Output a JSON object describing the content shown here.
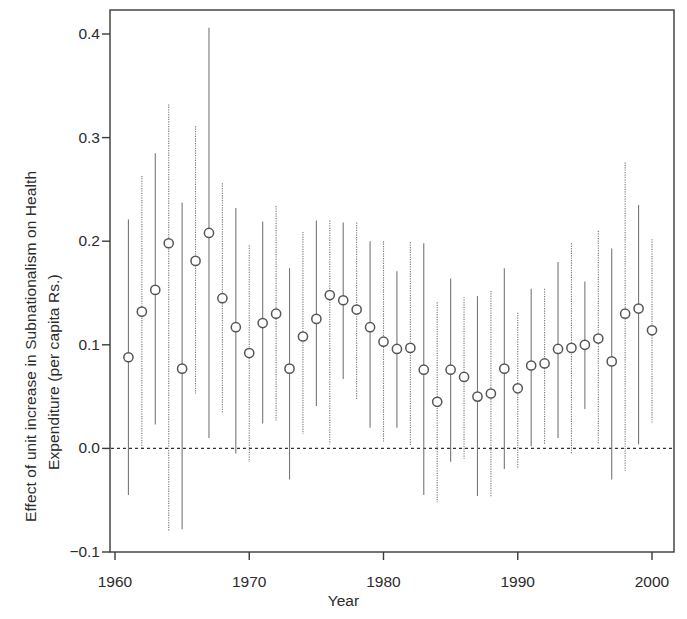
{
  "chart_data": {
    "type": "scatter",
    "title": "",
    "xlabel": "Year",
    "ylabel": "Effect of unit increase in Subnationalism on Health Expenditure (per capita Rs.)",
    "ylabel_line1": "Effect of unit increase in Subnationalism on Health",
    "ylabel_line2": "Expenditure (per capita Rs.)",
    "xlim": [
      1959.6,
      2001.6
    ],
    "ylim": [
      -0.1,
      0.43
    ],
    "xticks": [
      1960,
      1970,
      1980,
      1990,
      2000
    ],
    "xtick_labels": [
      "1960",
      "1970",
      "1980",
      "1990",
      "2000"
    ],
    "yticks": [
      -0.1,
      0.0,
      0.1,
      0.2,
      0.3,
      0.4
    ],
    "ytick_labels": [
      "-0.1",
      "0.0",
      "0.1",
      "0.2",
      "0.3",
      "0.4"
    ],
    "grid": false,
    "legend": null,
    "reference_line": {
      "y": 0.0,
      "style": "dotted",
      "color": "#333333"
    },
    "marker": {
      "shape": "circle-open",
      "color": "#555555",
      "size": 7
    },
    "errorbar": {
      "style": "vertical-line",
      "color": "#777777"
    },
    "x": [
      1961,
      1962,
      1963,
      1964,
      1965,
      1966,
      1967,
      1968,
      1969,
      1970,
      1971,
      1972,
      1973,
      1974,
      1975,
      1976,
      1977,
      1978,
      1979,
      1980,
      1981,
      1982,
      1983,
      1984,
      1985,
      1986,
      1987,
      1988,
      1989,
      1990,
      1991,
      1992,
      1993,
      1994,
      1995,
      1996,
      1997,
      1998,
      1999,
      2000
    ],
    "values": [
      0.088,
      0.132,
      0.153,
      0.198,
      0.077,
      0.181,
      0.208,
      0.145,
      0.117,
      0.092,
      0.121,
      0.13,
      0.077,
      0.108,
      0.125,
      0.148,
      0.143,
      0.134,
      0.117,
      0.103,
      0.096,
      0.097,
      0.076,
      0.045,
      0.076,
      0.069,
      0.05,
      0.053,
      0.077,
      0.058,
      0.08,
      0.082,
      0.096,
      0.097,
      0.1,
      0.106,
      0.084,
      0.13,
      0.135,
      0.114
    ],
    "lower": [
      -0.045,
      0.0,
      0.023,
      -0.08,
      -0.078,
      0.053,
      0.01,
      0.034,
      -0.005,
      -0.013,
      0.024,
      0.027,
      -0.03,
      0.014,
      0.041,
      0.004,
      0.067,
      0.047,
      0.02,
      0.006,
      0.02,
      0.002,
      -0.045,
      -0.052,
      -0.013,
      -0.01,
      -0.046,
      -0.047,
      -0.02,
      -0.02,
      0.002,
      0.004,
      0.01,
      -0.006,
      0.038,
      0.004,
      -0.03,
      -0.022,
      0.004,
      0.025
    ],
    "upper": [
      0.221,
      0.263,
      0.285,
      0.332,
      0.237,
      0.311,
      0.406,
      0.256,
      0.232,
      0.196,
      0.219,
      0.234,
      0.174,
      0.209,
      0.22,
      0.22,
      0.218,
      0.218,
      0.2,
      0.2,
      0.171,
      0.199,
      0.198,
      0.141,
      0.164,
      0.146,
      0.147,
      0.152,
      0.174,
      0.131,
      0.154,
      0.154,
      0.18,
      0.198,
      0.161,
      0.21,
      0.193,
      0.276,
      0.235,
      0.202
    ],
    "series": [
      {
        "name": "Effect estimate",
        "values": [
          0.088,
          0.132,
          0.153,
          0.198,
          0.077,
          0.181,
          0.208,
          0.145,
          0.117,
          0.092,
          0.121,
          0.13,
          0.077,
          0.108,
          0.125,
          0.148,
          0.143,
          0.134,
          0.117,
          0.103,
          0.096,
          0.097,
          0.076,
          0.045,
          0.076,
          0.069,
          0.05,
          0.053,
          0.077,
          0.058,
          0.08,
          0.082,
          0.096,
          0.097,
          0.1,
          0.106,
          0.084,
          0.13,
          0.135,
          0.114
        ]
      }
    ]
  }
}
